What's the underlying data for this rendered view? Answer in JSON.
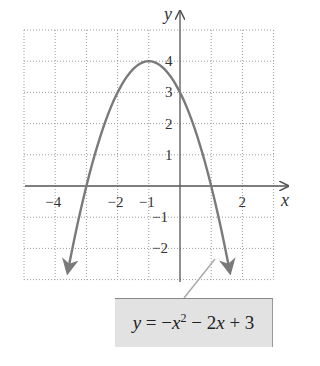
{
  "chart_data": {
    "type": "line",
    "title": "",
    "xlabel": "x",
    "ylabel": "y",
    "xlim": [
      -5,
      3
    ],
    "ylim": [
      -3,
      5
    ],
    "grid": true,
    "grid_style": "dotted",
    "x_tick_labels": [
      "-4",
      "-2",
      "-1",
      "2"
    ],
    "x_tick_values": [
      -4,
      -2,
      -1,
      2
    ],
    "y_tick_labels": [
      "4",
      "3",
      "2",
      "1",
      "-1",
      "-2"
    ],
    "y_tick_values": [
      4,
      3,
      2,
      1,
      -1,
      -2
    ],
    "series": [
      {
        "name": "y = -x^2 - 2x + 3",
        "equation": "y = -x² - 2x + 3",
        "x": [
          -3.6,
          -3,
          -2.5,
          -2,
          -1.5,
          -1,
          -0.5,
          0,
          0.5,
          1,
          1.6
        ],
        "values": [
          -2.76,
          0,
          1.75,
          3,
          3.75,
          4,
          3.75,
          3,
          1.75,
          0,
          -2.76
        ],
        "vertex": [
          -1,
          4
        ],
        "x_intercepts": [
          -3,
          1
        ],
        "y_intercept": 3,
        "color": "#7a7a7a",
        "arrows_at_ends": true
      }
    ],
    "annotations": [
      {
        "text": "y = -x² - 2x + 3",
        "type": "callout-box",
        "points_to": [
          1.1,
          -2.3
        ]
      }
    ]
  },
  "axes": {
    "x_label": "x",
    "y_label": "y",
    "x_ticks": [
      {
        "label": "−4",
        "value": -4
      },
      {
        "label": "−2",
        "value": -2
      },
      {
        "label": "−1",
        "value": -1
      },
      {
        "label": "2",
        "value": 2
      }
    ],
    "y_ticks": [
      {
        "label": "4",
        "value": 4
      },
      {
        "label": "3",
        "value": 3
      },
      {
        "label": "2",
        "value": 2
      },
      {
        "label": "1",
        "value": 1
      },
      {
        "label": "−1",
        "value": -1
      },
      {
        "label": "−2",
        "value": -2
      }
    ]
  },
  "equation_label": {
    "y": "y",
    "eq": " = −",
    "x1": "x",
    "exp": "2",
    "mid": " − 2",
    "x2": "x",
    "tail": " + 3"
  },
  "colors": {
    "curve": "#7a7a7a",
    "axis": "#555555",
    "grid": "#9a9a9a",
    "label_box": "#e2e2e2"
  }
}
